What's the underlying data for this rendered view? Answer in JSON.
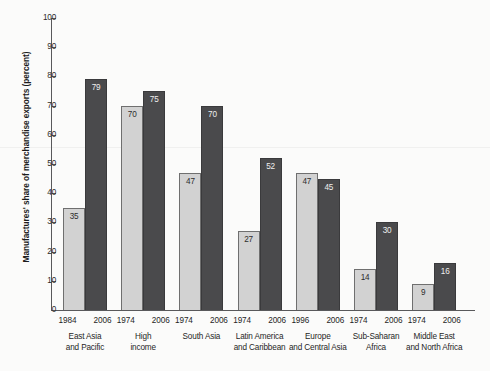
{
  "chart_data": {
    "type": "bar",
    "title": "",
    "subtitle": "",
    "xlabel": "",
    "ylabel": "Manufactures' share of merchandise exports (percent)",
    "ylim": [
      0,
      100
    ],
    "ytick_labels": [
      "100",
      "90",
      "80",
      "70",
      "60",
      "50",
      "40",
      "30",
      "20",
      "10",
      "0"
    ],
    "ytick_values": [
      100,
      90,
      80,
      70,
      60,
      50,
      40,
      30,
      20,
      10,
      0
    ],
    "grid": false,
    "legend": "none",
    "categories": [
      "East Asia and Pacific",
      "High income",
      "South Asia",
      "Latin America and Caribbean",
      "Europe and Central Asia",
      "Sub-Saharan Africa",
      "Middle East and North Africa"
    ],
    "series": [
      {
        "name": "earlier year",
        "color": "#d2d2d2",
        "values": [
          35,
          70,
          47,
          27,
          47,
          14,
          9
        ],
        "year_labels": [
          "1984",
          "1974",
          "1974",
          "1974",
          "1996",
          "1974",
          "1974"
        ]
      },
      {
        "name": "2006",
        "color": "#4a4a4c",
        "values": [
          79,
          75,
          70,
          52,
          45,
          30,
          16
        ],
        "year_labels": [
          "2006",
          "2006",
          "2006",
          "2006",
          "2006",
          "2006",
          "2006"
        ]
      }
    ],
    "groups": [
      {
        "region_lines": [
          "East Asia",
          "and Pacific"
        ],
        "bars": [
          {
            "year": "1984",
            "value": 35,
            "shade": "light"
          },
          {
            "year": "2006",
            "value": 79,
            "shade": "dark"
          }
        ]
      },
      {
        "region_lines": [
          "High",
          "income"
        ],
        "bars": [
          {
            "year": "1974",
            "value": 70,
            "shade": "light"
          },
          {
            "year": "2006",
            "value": 75,
            "shade": "dark"
          }
        ]
      },
      {
        "region_lines": [
          "South Asia"
        ],
        "bars": [
          {
            "year": "1974",
            "value": 47,
            "shade": "light"
          },
          {
            "year": "2006",
            "value": 70,
            "shade": "dark"
          }
        ]
      },
      {
        "region_lines": [
          "Latin America",
          "and Caribbean"
        ],
        "bars": [
          {
            "year": "1974",
            "value": 27,
            "shade": "light"
          },
          {
            "year": "2006",
            "value": 52,
            "shade": "dark"
          }
        ]
      },
      {
        "region_lines": [
          "Europe",
          "and Central Asia"
        ],
        "bars": [
          {
            "year": "1996",
            "value": 47,
            "shade": "light"
          },
          {
            "year": "2006",
            "value": 45,
            "shade": "dark"
          }
        ]
      },
      {
        "region_lines": [
          "Sub-Saharan",
          "Africa"
        ],
        "bars": [
          {
            "year": "1974",
            "value": 14,
            "shade": "light"
          },
          {
            "year": "2006",
            "value": 30,
            "shade": "dark"
          }
        ]
      },
      {
        "region_lines": [
          "Middle East",
          "and North Africa"
        ],
        "bars": [
          {
            "year": "1974",
            "value": 9,
            "shade": "light"
          },
          {
            "year": "2006",
            "value": 16,
            "shade": "dark"
          }
        ]
      }
    ],
    "colors": {
      "light_bar": "#d2d2d2",
      "dark_bar": "#4a4a4c",
      "axis": "#59595b",
      "background": "#fbfbfa",
      "text": "#1f1f1f"
    }
  }
}
